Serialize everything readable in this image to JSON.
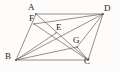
{
  "figure": {
    "type": "geometry-diagram",
    "canvas": {
      "width": 120,
      "height": 72
    },
    "background_color": "#fdfcfa",
    "ink_color": "#6b6258",
    "label_color": "#2b2724",
    "stroke_width": 0.7
  },
  "points": [
    {
      "id": "A",
      "label": "A",
      "x": 36,
      "y": 14,
      "label_x": 28,
      "label_y": 3,
      "kind": "vertex"
    },
    {
      "id": "D",
      "label": "D",
      "x": 103,
      "y": 14,
      "label_x": 104,
      "label_y": 4,
      "kind": "vertex"
    },
    {
      "id": "B",
      "label": "B",
      "x": 16,
      "y": 60,
      "label_x": 5,
      "label_y": 52,
      "kind": "vertex"
    },
    {
      "id": "C",
      "label": "C",
      "x": 88,
      "y": 60,
      "label_x": 84,
      "label_y": 57,
      "kind": "vertex"
    },
    {
      "id": "F",
      "label": "F",
      "x": 34,
      "y": 24,
      "label_x": 29,
      "label_y": 14,
      "kind": "interior"
    },
    {
      "id": "E",
      "label": "E",
      "x": 56,
      "y": 33,
      "label_x": 56,
      "label_y": 23,
      "kind": "interior"
    },
    {
      "id": "G",
      "label": "G",
      "x": 77,
      "y": 47,
      "label_x": 73,
      "label_y": 36,
      "kind": "interior"
    }
  ],
  "segments": [
    {
      "id": "AD",
      "from": "A",
      "to": "D",
      "role": "top-side"
    },
    {
      "id": "BC",
      "from": "B",
      "to": "C",
      "role": "bottom-side"
    },
    {
      "id": "AB",
      "from": "A",
      "to": "B",
      "role": "left-side"
    },
    {
      "id": "DC",
      "from": "D",
      "to": "C",
      "role": "right-side"
    },
    {
      "id": "AC",
      "from": "A",
      "to": "C",
      "role": "diagonal"
    },
    {
      "id": "BD",
      "from": "B",
      "to": "D",
      "role": "diagonal"
    },
    {
      "id": "FD",
      "from": "F",
      "to": "D",
      "role": "cevian"
    },
    {
      "id": "FC",
      "from": "F",
      "to": "C",
      "role": "cevian"
    },
    {
      "id": "BE",
      "from": "B",
      "to": "E",
      "role": "cevian"
    },
    {
      "id": "BG",
      "from": "B",
      "to": "G",
      "role": "cevian"
    },
    {
      "id": "DG",
      "from": "D",
      "to": "G",
      "role": "cevian"
    },
    {
      "id": "GC",
      "from": "G",
      "to": "C",
      "role": "cevian"
    }
  ]
}
